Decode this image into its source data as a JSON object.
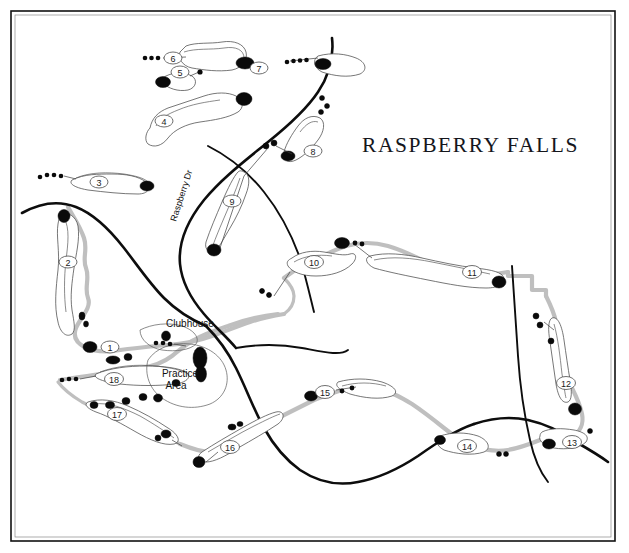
{
  "map": {
    "title": "RASPBERRY FALLS",
    "title_pos": {
      "x": 362,
      "y": 152
    },
    "frame": {
      "x": 11,
      "y": 11,
      "width": 604,
      "height": 530
    },
    "background_color": "#ffffff",
    "ink_color": "#0d0d0d",
    "cartpath_color": "#bfbfbf",
    "fairway_outline_color": "#4a4a4a",
    "hazard_color": "#0a0a0a",
    "type": "golf-course-map"
  },
  "labels": {
    "clubhouse": {
      "text": "Clubhouse",
      "x": 190,
      "y": 327
    },
    "practice_area_line1": {
      "text": "Practice",
      "x": 180,
      "y": 377
    },
    "practice_area_line2": {
      "text": "Area",
      "x": 176,
      "y": 388
    },
    "road_name": {
      "text": "Raspberry Dr",
      "x": 176,
      "y": 222,
      "rotation": -72
    }
  },
  "holes": [
    {
      "number": "1",
      "cx": 110,
      "cy": 347,
      "r": 7.5
    },
    {
      "number": "2",
      "cx": 68,
      "cy": 262,
      "r": 7.5
    },
    {
      "number": "3",
      "cx": 99,
      "cy": 182,
      "r": 7.5
    },
    {
      "number": "4",
      "cx": 164,
      "cy": 121,
      "r": 7.5
    },
    {
      "number": "5",
      "cx": 180,
      "cy": 72,
      "r": 7.5
    },
    {
      "number": "6",
      "cx": 173,
      "cy": 58,
      "r": 7.5
    },
    {
      "number": "7",
      "cx": 259,
      "cy": 68,
      "r": 7.5
    },
    {
      "number": "8",
      "cx": 313,
      "cy": 151,
      "r": 7.5
    },
    {
      "number": "9",
      "cx": 232,
      "cy": 201,
      "r": 7.5
    },
    {
      "number": "10",
      "cx": 314,
      "cy": 262,
      "r": 8.0
    },
    {
      "number": "11",
      "cx": 472,
      "cy": 272,
      "r": 8.0
    },
    {
      "number": "12",
      "cx": 566,
      "cy": 383,
      "r": 8.0
    },
    {
      "number": "13",
      "cx": 572,
      "cy": 442,
      "r": 8.0
    },
    {
      "number": "14",
      "cx": 467,
      "cy": 446,
      "r": 8.0
    },
    {
      "number": "15",
      "cx": 325,
      "cy": 392,
      "r": 8.0
    },
    {
      "number": "16",
      "cx": 230,
      "cy": 447,
      "r": 8.0
    },
    {
      "number": "17",
      "cx": 117,
      "cy": 414,
      "r": 8.0
    },
    {
      "number": "18",
      "cx": 114,
      "cy": 379,
      "r": 8.0
    }
  ],
  "tee_groups": [
    {
      "hole": "6",
      "dots": [
        [
          145,
          58
        ],
        [
          151,
          58
        ],
        [
          157,
          58
        ],
        [
          163,
          58
        ]
      ]
    },
    {
      "hole": "7",
      "dots": [
        [
          287,
          61
        ],
        [
          293,
          60
        ],
        [
          299,
          60
        ],
        [
          306,
          60
        ],
        [
          313,
          60
        ]
      ]
    },
    {
      "hole": "5",
      "dots": [
        [
          199,
          72
        ]
      ]
    },
    {
      "hole": "8",
      "dots": [
        [
          265,
          145
        ],
        [
          273,
          143
        ]
      ]
    },
    {
      "hole": "9",
      "dots": [
        [
          321,
          98
        ],
        [
          325,
          104
        ],
        [
          320,
          110
        ]
      ]
    },
    {
      "hole": "3",
      "dots": [
        [
          40,
          176
        ],
        [
          48,
          174
        ],
        [
          55,
          174
        ],
        [
          62,
          175
        ]
      ]
    },
    {
      "hole": "10",
      "dots": [
        [
          260,
          290
        ],
        [
          266,
          293
        ],
        [
          272,
          295
        ]
      ]
    },
    {
      "hole": "10b",
      "dots": [
        [
          348,
          241
        ],
        [
          355,
          242
        ]
      ]
    },
    {
      "hole": "18",
      "dots": [
        [
          62,
          379
        ],
        [
          69,
          378
        ],
        [
          76,
          379
        ]
      ]
    },
    {
      "hole": "1",
      "dots": [
        [
          156,
          343
        ],
        [
          163,
          343
        ],
        [
          170,
          344
        ]
      ]
    },
    {
      "hole": "15",
      "dots": [
        [
          342,
          390
        ],
        [
          351,
          388
        ]
      ]
    },
    {
      "hole": "14",
      "dots": [
        [
          497,
          453
        ],
        [
          504,
          453
        ]
      ]
    },
    {
      "hole": "13",
      "dots": [
        [
          588,
          430
        ],
        [
          595,
          431
        ]
      ]
    },
    {
      "hole": "16",
      "dots": [
        [
          196,
          463
        ],
        [
          203,
          463
        ]
      ]
    }
  ],
  "hazards_count": 38,
  "cart_paths_count": 9
}
